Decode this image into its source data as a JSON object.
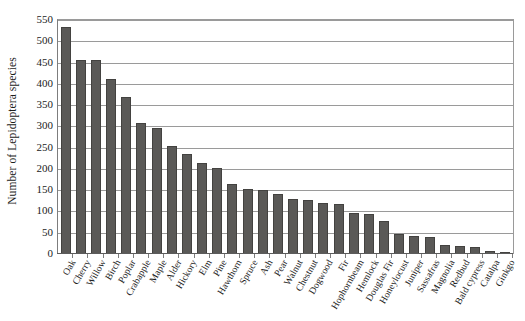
{
  "chart_data": {
    "type": "bar",
    "title": "",
    "xlabel": "",
    "ylabel": "Number of Lepidoptera species",
    "ylim": [
      0,
      550
    ],
    "ytick_step": 50,
    "grid": true,
    "legend": "none",
    "bar_color": "#5a5957",
    "bar_border_color": "#434240",
    "gridline_color": "#9a9a9a",
    "axis_color": "#5c5c5c",
    "yticks": [
      0,
      50,
      100,
      150,
      200,
      250,
      300,
      350,
      400,
      450,
      500,
      550
    ],
    "categories": [
      "Oak",
      "Cherry",
      "Willow",
      "Birch",
      "Poplar",
      "Crabapple",
      "Maple",
      "Alder",
      "Hickory",
      "Elm",
      "Pine",
      "Hawthorn",
      "Spruce",
      "Ash",
      "Pear",
      "Walnut",
      "Chestnut",
      "Dogwood",
      "Fir",
      "Hophornbeam",
      "Hemlock",
      "Douglas Fir",
      "Honeylocust",
      "Juniper",
      "Sassafras",
      "Magnolia",
      "Redbud",
      "Bald cypress",
      "Catalpa",
      "Ginkgo"
    ],
    "values": [
      534,
      456,
      455,
      411,
      368,
      308,
      297,
      255,
      235,
      215,
      203,
      165,
      152,
      151,
      140,
      130,
      127,
      119,
      118,
      96,
      94,
      78,
      46,
      43,
      40,
      21,
      19,
      16,
      7,
      4
    ]
  }
}
